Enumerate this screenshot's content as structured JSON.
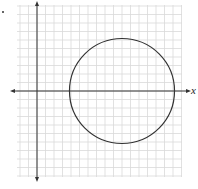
{
  "chart_data": {
    "type": "line",
    "title": "",
    "xlabel": "x",
    "ylabel": "",
    "grid": true,
    "xlim": [
      -3,
      16.5
    ],
    "ylim": [
      -10.5,
      10.5
    ],
    "grid_step": 1,
    "axes": {
      "x_arrows": "both",
      "y_arrows": "both"
    },
    "shapes": [
      {
        "kind": "circle",
        "center": [
          10,
          0
        ],
        "radius": 6
      }
    ],
    "legend": null
  },
  "labels": {
    "x_axis": "x"
  },
  "colors": {
    "grid": "#d9d9d9",
    "axis": "#333333",
    "circle": "#333333",
    "background": "#ffffff"
  }
}
